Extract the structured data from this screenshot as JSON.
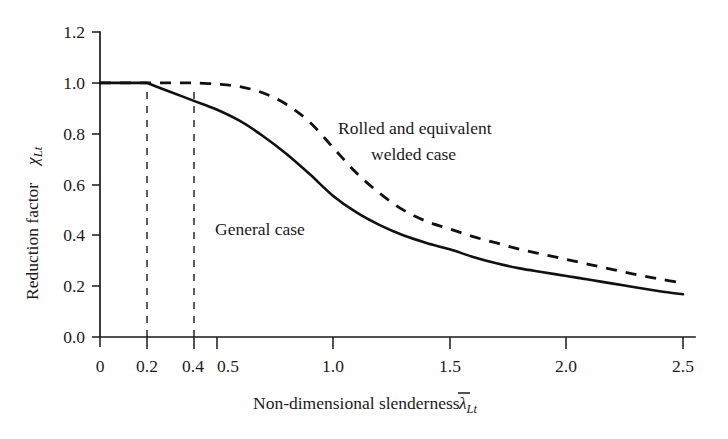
{
  "chart_data": {
    "type": "line",
    "title": "",
    "xlabel": "Non-dimensional slenderness",
    "xlabel_symbol": "λ",
    "xlabel_symbol_sub": "Lt",
    "xlabel_overbar": true,
    "ylabel": "Reduction factor",
    "ylabel_symbol": "χ",
    "ylabel_symbol_sub": "Lt",
    "xlim": [
      0,
      2.5
    ],
    "ylim": [
      0.0,
      1.2
    ],
    "grid": false,
    "legend_position": "inline-annotations",
    "x_ticks": [
      0,
      0.2,
      0.4,
      0.5,
      1.0,
      1.5,
      2.0,
      2.5
    ],
    "x_tick_labels": [
      "0",
      "0.2",
      "0.4",
      "0.5",
      "1.0",
      "1.5",
      "2.0",
      "2.5"
    ],
    "y_ticks": [
      0.0,
      0.2,
      0.4,
      0.6,
      0.8,
      1.0,
      1.2
    ],
    "y_tick_labels": [
      "0.0",
      "0.2",
      "0.4",
      "0.6",
      "0.8",
      "1.0",
      "1.2"
    ],
    "series": [
      {
        "name": "General case",
        "style": "solid",
        "plateau_end": 0.2,
        "x": [
          0.0,
          0.2,
          0.3,
          0.4,
          0.5,
          0.6,
          0.7,
          0.8,
          0.9,
          1.0,
          1.1,
          1.2,
          1.3,
          1.4,
          1.5,
          1.6,
          1.7,
          1.8,
          1.9,
          2.0,
          2.1,
          2.2,
          2.3,
          2.4,
          2.5
        ],
        "values": [
          1.0,
          1.0,
          0.965,
          0.93,
          0.895,
          0.85,
          0.79,
          0.72,
          0.64,
          0.555,
          0.49,
          0.44,
          0.4,
          0.37,
          0.345,
          0.315,
          0.29,
          0.27,
          0.255,
          0.24,
          0.225,
          0.21,
          0.195,
          0.18,
          0.168
        ]
      },
      {
        "name": "Rolled and equivalent welded case",
        "style": "dashed",
        "plateau_end": 0.4,
        "x": [
          0.0,
          0.4,
          0.5,
          0.6,
          0.7,
          0.8,
          0.9,
          1.0,
          1.1,
          1.2,
          1.3,
          1.4,
          1.5,
          1.6,
          1.7,
          1.8,
          1.9,
          2.0,
          2.1,
          2.2,
          2.3,
          2.4,
          2.5
        ],
        "values": [
          1.0,
          1.0,
          0.995,
          0.985,
          0.96,
          0.915,
          0.845,
          0.745,
          0.645,
          0.565,
          0.5,
          0.455,
          0.425,
          0.395,
          0.37,
          0.345,
          0.325,
          0.305,
          0.285,
          0.265,
          0.245,
          0.228,
          0.212
        ]
      }
    ],
    "guide_lines": [
      {
        "x": 0.2,
        "from_y": 0.0,
        "to_y": 1.0
      },
      {
        "x": 0.4,
        "from_y": 0.0,
        "to_y": 0.935
      }
    ],
    "annotations": [
      {
        "name": "rolled-welded-label-line1",
        "text": "Rolled and equivalent",
        "x": 1.02,
        "y": 0.875
      },
      {
        "name": "rolled-welded-label-line2",
        "text": "welded case",
        "x": 1.16,
        "y": 0.795
      },
      {
        "name": "general-case-label",
        "text": "General case",
        "x": 0.49,
        "y": 0.515
      }
    ],
    "colors": {
      "axis": "#1a1a1a",
      "curve": "#111111",
      "background": "#ffffff"
    }
  }
}
